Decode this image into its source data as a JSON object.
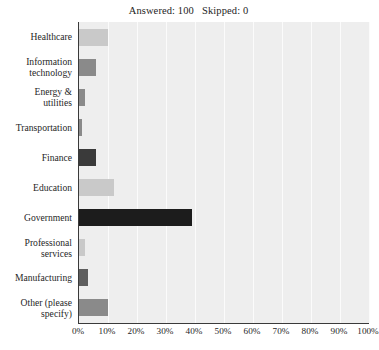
{
  "header": {
    "summary_text": "Answered: 100   Skipped: 0",
    "answered_label": "Answered:",
    "answered_count": "100",
    "skipped_label": "Skipped:",
    "skipped_count": "0"
  },
  "colors": {
    "plot_background": "#eeeeee",
    "gridline": "#fbfbfb",
    "axis": "#3a3a3a",
    "bar_light": "#c9c9c9",
    "bar_medium": "#8a8a8a",
    "bar_dark": "#3a3a3a",
    "bar_darkest": "#1c1c1c",
    "text": "#1f1f1f"
  },
  "chart_data": {
    "type": "bar",
    "orientation": "horizontal",
    "title": "Answered: 100   Skipped: 0",
    "xlabel": "",
    "ylabel": "",
    "xlim": [
      0,
      100
    ],
    "grid": true,
    "legend": "none",
    "x_tick_labels": [
      "0%",
      "10%",
      "20%",
      "30%",
      "40%",
      "50%",
      "60%",
      "70%",
      "80%",
      "90%",
      "100%"
    ],
    "x_tick_values": [
      0,
      10,
      20,
      30,
      40,
      50,
      60,
      70,
      80,
      90,
      100
    ],
    "categories": [
      "Healthcare",
      "Information technology",
      "Energy & utilities",
      "Transportation",
      "Finance",
      "Education",
      "Government",
      "Professional services",
      "Manufacturing",
      "Other (please specify)"
    ],
    "category_lines": [
      [
        "Healthcare"
      ],
      [
        "Information",
        "technology"
      ],
      [
        "Energy &",
        "utilities"
      ],
      [
        "Transportation"
      ],
      [
        "Finance"
      ],
      [
        "Education"
      ],
      [
        "Government"
      ],
      [
        "Professional",
        "services"
      ],
      [
        "Manufacturing"
      ],
      [
        "Other (please",
        "specify)"
      ]
    ],
    "values": [
      10,
      6,
      2,
      1,
      6,
      12,
      39,
      2,
      3,
      10
    ],
    "bars": [
      {
        "label": "Healthcare",
        "value": 10,
        "color": "#c9c9c9"
      },
      {
        "label": "Information technology",
        "value": 6,
        "color": "#8a8a8a"
      },
      {
        "label": "Energy & utilities",
        "value": 2,
        "color": "#8a8a8a"
      },
      {
        "label": "Transportation",
        "value": 1,
        "color": "#8a8a8a"
      },
      {
        "label": "Finance",
        "value": 6,
        "color": "#3a3a3a"
      },
      {
        "label": "Education",
        "value": 12,
        "color": "#c9c9c9"
      },
      {
        "label": "Government",
        "value": 39,
        "color": "#1c1c1c"
      },
      {
        "label": "Professional services",
        "value": 2,
        "color": "#c9c9c9"
      },
      {
        "label": "Manufacturing",
        "value": 3,
        "color": "#5e5e5e"
      },
      {
        "label": "Other (please specify)",
        "value": 10,
        "color": "#8a8a8a"
      }
    ]
  }
}
